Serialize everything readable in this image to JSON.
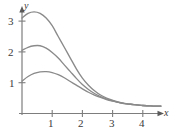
{
  "figure": {
    "title": "",
    "background_color": "#ffffff",
    "curve_color": "#8a8a8a",
    "axis_color": "#7d7d7d",
    "text_color": "#3a3a3a"
  },
  "axes": {
    "x_name": "x",
    "y_name": "y",
    "x_ticks": [
      {
        "label": "1",
        "value": 1
      },
      {
        "label": "2",
        "value": 2
      },
      {
        "label": "3",
        "value": 3
      },
      {
        "label": "4",
        "value": 4
      }
    ],
    "y_ticks": [
      {
        "label": "1",
        "value": 1
      },
      {
        "label": "2",
        "value": 2
      },
      {
        "label": "3",
        "value": 3
      }
    ]
  },
  "chart_data": {
    "type": "line",
    "title": "",
    "xlabel": "x",
    "ylabel": "y",
    "xlim": [
      0,
      4.6
    ],
    "ylim": [
      0,
      3.5
    ],
    "grid": false,
    "legend": "none",
    "series": [
      {
        "name": "curve-top",
        "x": [
          0,
          0.2,
          0.4,
          0.6,
          0.8,
          1.0,
          1.2,
          1.4,
          1.6,
          1.8,
          2.0,
          2.2,
          2.4,
          2.6,
          2.8,
          3.0,
          3.2,
          3.4,
          3.6,
          3.8,
          4.0,
          4.2,
          4.4,
          4.6
        ],
        "y": [
          3.1,
          3.25,
          3.3,
          3.25,
          3.1,
          2.85,
          2.5,
          2.15,
          1.8,
          1.45,
          1.15,
          0.92,
          0.74,
          0.6,
          0.5,
          0.43,
          0.37,
          0.33,
          0.3,
          0.28,
          0.26,
          0.25,
          0.24,
          0.24
        ]
      },
      {
        "name": "curve-middle",
        "x": [
          0,
          0.2,
          0.4,
          0.6,
          0.8,
          1.0,
          1.2,
          1.4,
          1.6,
          1.8,
          2.0,
          2.2,
          2.4,
          2.6,
          2.8,
          3.0,
          3.2,
          3.4,
          3.6,
          3.8,
          4.0,
          4.2,
          4.4,
          4.6
        ],
        "y": [
          2.05,
          2.15,
          2.2,
          2.2,
          2.12,
          1.98,
          1.8,
          1.58,
          1.36,
          1.14,
          0.94,
          0.78,
          0.65,
          0.55,
          0.47,
          0.41,
          0.36,
          0.32,
          0.3,
          0.28,
          0.26,
          0.25,
          0.24,
          0.24
        ]
      },
      {
        "name": "curve-bottom",
        "x": [
          0,
          0.2,
          0.4,
          0.6,
          0.8,
          1.0,
          1.2,
          1.4,
          1.6,
          1.8,
          2.0,
          2.2,
          2.4,
          2.6,
          2.8,
          3.0,
          3.2,
          3.4,
          3.6,
          3.8,
          4.0,
          4.2,
          4.4,
          4.6
        ],
        "y": [
          1.05,
          1.2,
          1.3,
          1.35,
          1.36,
          1.33,
          1.26,
          1.16,
          1.04,
          0.92,
          0.8,
          0.69,
          0.6,
          0.52,
          0.45,
          0.4,
          0.36,
          0.32,
          0.3,
          0.28,
          0.26,
          0.25,
          0.24,
          0.24
        ]
      }
    ]
  }
}
